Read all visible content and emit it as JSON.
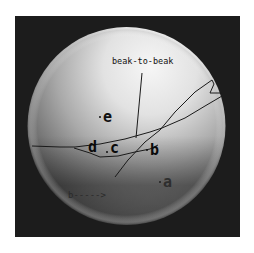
{
  "figure": {
    "type": "shaded-sphere-diagram",
    "background": "#ffffff",
    "frame_color": "#1c1c1c",
    "sphere": {
      "highlight_color": "#f4f4f4",
      "mid_color": "#a8a8a8",
      "shadow_color": "#3a3a3a",
      "light_direction": "upper-right"
    },
    "annotation": {
      "label": "beak-to-beak"
    },
    "points": [
      {
        "id": "a",
        "label": "a"
      },
      {
        "id": "b",
        "label": "b"
      },
      {
        "id": "c",
        "label": "c"
      },
      {
        "id": "d",
        "label": "d"
      },
      {
        "id": "e",
        "label": "e"
      }
    ],
    "bottom_label": "b----->",
    "curves": [
      {
        "name": "upper-boundary-curve"
      },
      {
        "name": "lower-boundary-curve"
      },
      {
        "name": "diagonal-path-curve"
      },
      {
        "name": "beak-to-beak-leader-line"
      }
    ]
  }
}
